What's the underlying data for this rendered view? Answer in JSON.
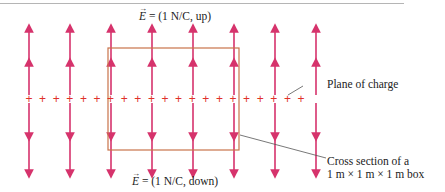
{
  "figure": {
    "top_field_label": {
      "symbol": "E",
      "text": " = (1 N/C, up)"
    },
    "bottom_field_label": {
      "symbol": "E",
      "text": " = (1 N/C, down)"
    },
    "plane_label": "Plane of charge",
    "box_label_line1": "Cross section of a",
    "box_label_line2": "1 m × 1 m × 1 m box",
    "charge_symbol": "+",
    "colors": {
      "field_arrow": "#d6336c",
      "charge": "#e0302a",
      "box": "#c8734a",
      "leader_line": "#555555",
      "text": "#222222"
    },
    "arrow_columns_x": [
      29,
      70,
      111,
      152,
      193,
      234,
      275,
      316
    ],
    "charge_count": 21
  }
}
